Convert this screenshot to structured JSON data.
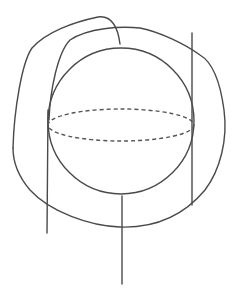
{
  "diagram": {
    "type": "line-drawing",
    "stroke_color": "#4a4a4a",
    "stroke_width": 1.4,
    "dash_color": "#555555",
    "background": "#ffffff",
    "sphere": {
      "cx": 121,
      "cy": 121,
      "r": 73
    },
    "equator": {
      "cx": 121,
      "cy": 125,
      "rx": 73,
      "ry": 16,
      "dash": "4 3"
    },
    "vertical_lines": [
      {
        "name": "left-line",
        "x1": 48,
        "y1": 110,
        "x2": 47,
        "y2": 233
      },
      {
        "name": "right-line",
        "x1": 192,
        "y1": 33,
        "x2": 192,
        "y2": 205
      },
      {
        "name": "center-line",
        "x1": 122,
        "y1": 197,
        "x2": 122,
        "y2": 284
      }
    ]
  }
}
